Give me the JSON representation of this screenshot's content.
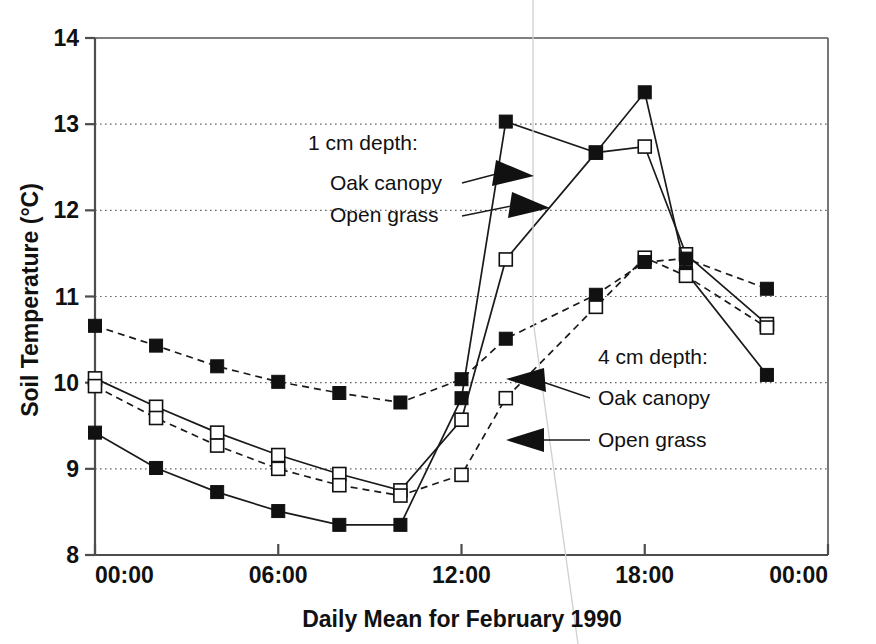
{
  "chart_data": {
    "type": "line",
    "title": "",
    "xlabel": "Daily Mean for February 1990",
    "ylabel": "Soil Temperature (°C)",
    "ylim": [
      8,
      14
    ],
    "yticks": [
      8,
      9,
      10,
      11,
      12,
      13,
      14
    ],
    "ytick_labels": [
      "8",
      "9",
      "10",
      "11",
      "12",
      "13",
      "14"
    ],
    "xlim_hours": [
      0,
      24
    ],
    "xticks_hours": [
      0,
      6,
      12,
      18,
      24
    ],
    "xtick_labels": [
      "00:00",
      "06:00",
      "12:00",
      "18:00",
      "00:00"
    ],
    "grid": "horizontal-dotted",
    "legend_position": "inline-annotations",
    "series": [
      {
        "name": "1 cm depth: Oak canopy",
        "depth": "1 cm",
        "site": "Oak canopy",
        "marker": "open-square",
        "line": "solid",
        "x_hours": [
          0,
          2,
          4,
          6,
          8,
          10,
          12,
          13.45,
          16.4,
          18,
          19.35,
          22
        ],
        "values": [
          10.05,
          9.72,
          9.42,
          9.16,
          8.94,
          8.75,
          9.57,
          11.43,
          12.67,
          12.74,
          11.49,
          10.68
        ]
      },
      {
        "name": "1 cm depth: Open grass",
        "depth": "1 cm",
        "site": "Open grass",
        "marker": "filled-square",
        "line": "solid",
        "x_hours": [
          0,
          2,
          4,
          6,
          8,
          10,
          12,
          13.45,
          16.4,
          18,
          19.35,
          22
        ],
        "values": [
          9.42,
          9.01,
          8.73,
          8.51,
          8.35,
          8.35,
          9.82,
          13.03,
          12.67,
          13.37,
          11.28,
          10.09
        ]
      },
      {
        "name": "4 cm depth: Oak canopy",
        "depth": "4 cm",
        "site": "Oak canopy",
        "marker": "open-square",
        "line": "dashed",
        "x_hours": [
          0,
          2,
          4,
          6,
          8,
          10,
          12,
          13.45,
          16.4,
          18,
          19.35,
          22
        ],
        "values": [
          9.96,
          9.59,
          9.27,
          9.0,
          8.81,
          8.69,
          8.93,
          9.82,
          10.88,
          11.45,
          11.24,
          10.64
        ]
      },
      {
        "name": "4 cm depth: Open grass",
        "depth": "4 cm",
        "site": "Open grass",
        "marker": "filled-square",
        "line": "dashed",
        "x_hours": [
          0,
          2,
          4,
          6,
          8,
          10,
          12,
          13.45,
          16.4,
          18,
          19.35,
          22
        ],
        "values": [
          10.66,
          10.43,
          10.19,
          10.01,
          9.88,
          9.77,
          10.04,
          10.51,
          11.02,
          11.4,
          11.44,
          11.09
        ]
      }
    ],
    "annotations": [
      {
        "id": "anno-1cm-head",
        "text": "1 cm depth:"
      },
      {
        "id": "anno-1cm-oak",
        "text": "Oak canopy"
      },
      {
        "id": "anno-1cm-grass",
        "text": "Open grass"
      },
      {
        "id": "anno-4cm-head",
        "text": "4 cm depth:"
      },
      {
        "id": "anno-4cm-oak",
        "text": "Oak canopy"
      },
      {
        "id": "anno-4cm-grass",
        "text": "Open grass"
      }
    ],
    "colors": {
      "line": "#1a1a1a",
      "marker_fill": "#111111",
      "marker_open_fill": "#ffffff",
      "axis": "#4d4d4d",
      "grid": "#666666",
      "background": "#ffffff"
    }
  },
  "axes": {
    "y_title": "Soil Temperature (°C)",
    "x_title": "Daily Mean for February 1990",
    "y_ticks": [
      "14",
      "13",
      "12",
      "11",
      "10",
      "9",
      "8"
    ],
    "x_ticks": [
      "00:00",
      "06:00",
      "12:00",
      "18:00",
      "00:00"
    ]
  },
  "annotations": {
    "group_1cm": {
      "heading": "1 cm depth:",
      "oak": "Oak canopy",
      "grass": "Open grass"
    },
    "group_4cm": {
      "heading": "4 cm depth:",
      "oak": "Oak canopy",
      "grass": "Open grass"
    }
  }
}
